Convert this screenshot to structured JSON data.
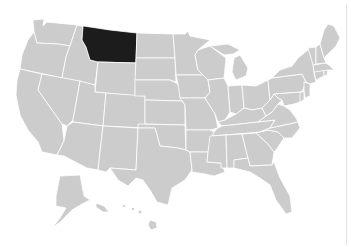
{
  "map": {
    "title": "United States",
    "highlighted_state": "Montana",
    "colors": {
      "default_fill": "#cccccc",
      "highlight_fill": "#1c1c1c",
      "border": "#ffffff",
      "background": "#ffffff"
    },
    "states_shown": [
      "Washington",
      "Oregon",
      "California",
      "Idaho",
      "Nevada",
      "Montana",
      "Wyoming",
      "Utah",
      "Arizona",
      "Colorado",
      "New Mexico",
      "North Dakota",
      "South Dakota",
      "Nebraska",
      "Kansas",
      "Oklahoma",
      "Texas",
      "Minnesota",
      "Iowa",
      "Missouri",
      "Arkansas",
      "Louisiana",
      "Wisconsin",
      "Illinois",
      "Michigan",
      "Indiana",
      "Ohio",
      "Kentucky",
      "Tennessee",
      "Mississippi",
      "Alabama",
      "Georgia",
      "Florida",
      "South Carolina",
      "North Carolina",
      "Virginia",
      "West Virginia",
      "Pennsylvania",
      "New York",
      "Maryland",
      "Delaware",
      "New Jersey",
      "Connecticut",
      "Rhode Island",
      "Massachusetts",
      "Vermont",
      "New Hampshire",
      "Maine",
      "Alaska",
      "Hawaii"
    ]
  }
}
